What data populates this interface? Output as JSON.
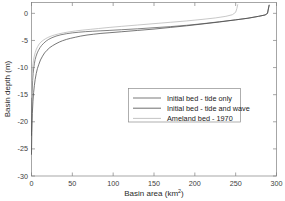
{
  "chart_data": {
    "type": "line",
    "title": "",
    "subtitle": "",
    "xlabel": "Basin area (km",
    "xlabel_sup": "2",
    "xlabel_tail": ")",
    "xlabel_full": "Basin area (km2)",
    "ylabel": "Basin depth (m)",
    "xlim": [
      0,
      300
    ],
    "ylim": [
      -30,
      2
    ],
    "xticks": [
      0,
      50,
      100,
      150,
      200,
      250,
      300
    ],
    "yticks": [
      0,
      -5,
      -10,
      -15,
      -20,
      -25,
      -30
    ],
    "xticklabels": [
      "0",
      "50",
      "100",
      "150",
      "200",
      "250",
      "300"
    ],
    "yticklabels": [
      "0",
      "-5",
      "-10",
      "-15",
      "-20",
      "-25",
      "-30"
    ],
    "grid": false,
    "legend_position": "center-right",
    "series": [
      {
        "name": "Initial bed - tide only",
        "color": "#595959",
        "x": [
          0.0,
          0.3,
          0.8,
          1.4,
          2.0,
          2.8,
          3.6,
          4.5,
          5.6,
          7.0,
          8.6,
          10.5,
          12.5,
          15.0,
          18.0,
          21.0,
          25.0,
          30.0,
          36.0,
          43.0,
          50.0,
          58.0,
          66.0,
          75.0,
          85.0,
          95.0,
          110.0,
          130.0,
          150.0,
          170.0,
          190.0,
          210.0,
          230.0,
          250.0,
          265.0,
          278.0,
          286.0,
          289.0,
          290.0,
          291.0
        ],
        "y": [
          -22.5,
          -18.0,
          -14.5,
          -12.4,
          -11.1,
          -10.0,
          -9.2,
          -8.5,
          -7.9,
          -7.3,
          -6.8,
          -6.3,
          -5.9,
          -5.5,
          -5.1,
          -4.8,
          -4.5,
          -4.2,
          -3.95,
          -3.75,
          -3.6,
          -3.48,
          -3.38,
          -3.3,
          -3.22,
          -3.15,
          -3.02,
          -2.85,
          -2.65,
          -2.45,
          -2.2,
          -1.9,
          -1.55,
          -1.2,
          -0.9,
          -0.55,
          -0.3,
          0.0,
          0.8,
          1.5
        ]
      },
      {
        "name": "Initial bed - tide and wave",
        "color": "#4a4a4a",
        "x": [
          0.0,
          0.4,
          1.0,
          1.8,
          2.6,
          3.5,
          4.5,
          5.8,
          7.2,
          9.0,
          11.0,
          13.5,
          16.0,
          19.0,
          22.5,
          26.0,
          30.0,
          34.0,
          38.0,
          43.0,
          48.0,
          54.0,
          60.0,
          68.0,
          76.0,
          85.0,
          95.0,
          110.0,
          130.0,
          150.0,
          170.0,
          190.0,
          210.0,
          230.0,
          250.0,
          265.0,
          278.0,
          286.0,
          289.0,
          290.0,
          291.0
        ],
        "y": [
          -26.0,
          -22.0,
          -18.5,
          -16.2,
          -14.6,
          -13.3,
          -12.2,
          -11.1,
          -10.2,
          -9.4,
          -8.6,
          -7.9,
          -7.3,
          -6.8,
          -6.3,
          -5.95,
          -5.6,
          -5.3,
          -5.05,
          -4.8,
          -4.6,
          -4.4,
          -4.2,
          -4.0,
          -3.85,
          -3.7,
          -3.58,
          -3.4,
          -3.15,
          -2.9,
          -2.6,
          -2.3,
          -1.95,
          -1.6,
          -1.2,
          -0.9,
          -0.55,
          -0.3,
          0.0,
          0.8,
          1.5
        ]
      },
      {
        "name": "Ameland bed - 1970",
        "color": "#b5b5b5",
        "x": [
          0.0,
          0.3,
          0.8,
          1.5,
          2.4,
          3.4,
          4.6,
          6.0,
          7.6,
          9.5,
          11.5,
          14.0,
          17.0,
          20.0,
          24.0,
          28.0,
          33.0,
          39.0,
          46.0,
          54.0,
          62.0,
          72.0,
          82.0,
          95.0,
          110.0,
          130.0,
          150.0,
          170.0,
          190.0,
          210.0,
          225.0,
          238.0,
          246.0,
          250.0,
          251.5,
          252.5
        ],
        "y": [
          -15.5,
          -13.2,
          -11.2,
          -9.8,
          -8.7,
          -7.9,
          -7.2,
          -6.6,
          -6.1,
          -5.65,
          -5.3,
          -5.0,
          -4.7,
          -4.45,
          -4.2,
          -4.0,
          -3.8,
          -3.6,
          -3.42,
          -3.25,
          -3.1,
          -2.95,
          -2.8,
          -2.6,
          -2.4,
          -2.15,
          -1.9,
          -1.65,
          -1.4,
          -1.1,
          -0.85,
          -0.55,
          -0.25,
          0.2,
          0.9,
          1.6
        ]
      }
    ]
  },
  "figure": {
    "background_color": "#ffffff",
    "axis_color": "#808080"
  }
}
